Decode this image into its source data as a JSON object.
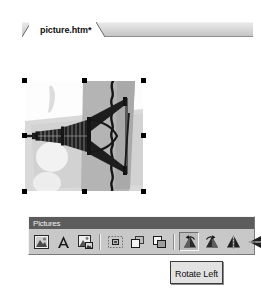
{
  "document_tab": {
    "label": "picture.htm*",
    "modified_marker": "*",
    "name": "picture.htm"
  },
  "canvas": {
    "selected": true,
    "handle_count": 8,
    "handle_color": "#000000",
    "image_description": "Eiffel Tower photo rotated 90 degrees counter-clockwise",
    "image_colors": {
      "sky": "#b6b6b6",
      "ground": "#d6d6d6",
      "tower": "#1e1e1e",
      "highlight": "#efefef"
    }
  },
  "toolbar": {
    "title": "Pictures",
    "title_bg": "#5c5c5c",
    "title_fg": "#f0f0f0",
    "face_color": "#c8c8c8",
    "buttons": [
      {
        "name": "insert-picture-from-file-button",
        "icon": "picture-icon",
        "label": "Insert Picture From File",
        "pressed": false
      },
      {
        "name": "text-button",
        "icon": "text-a-icon",
        "label": "Text",
        "pressed": false
      },
      {
        "name": "auto-thumbnail-button",
        "icon": "thumbnail-icon",
        "label": "Auto Thumbnail",
        "pressed": false
      },
      {
        "name": "position-absolutely-button",
        "icon": "position-absolutely-icon",
        "label": "Position Absolutely",
        "pressed": false
      },
      {
        "name": "bring-forward-button",
        "icon": "bring-forward-icon",
        "label": "Bring Forward",
        "pressed": false
      },
      {
        "name": "send-backward-button",
        "icon": "send-backward-icon",
        "label": "Send Backward",
        "pressed": false
      },
      {
        "name": "rotate-left-button",
        "icon": "rotate-left-icon",
        "label": "Rotate Left",
        "pressed": true
      },
      {
        "name": "rotate-right-button",
        "icon": "rotate-right-icon",
        "label": "Rotate Right",
        "pressed": false
      },
      {
        "name": "flip-horizontal-button",
        "icon": "flip-horizontal-icon",
        "label": "Flip Horizontal",
        "pressed": false
      },
      {
        "name": "flip-vertical-button",
        "icon": "flip-vertical-icon",
        "label": "Flip Vertical",
        "pressed": false
      }
    ]
  },
  "tooltip": {
    "text": "Rotate Left",
    "visible": true
  }
}
